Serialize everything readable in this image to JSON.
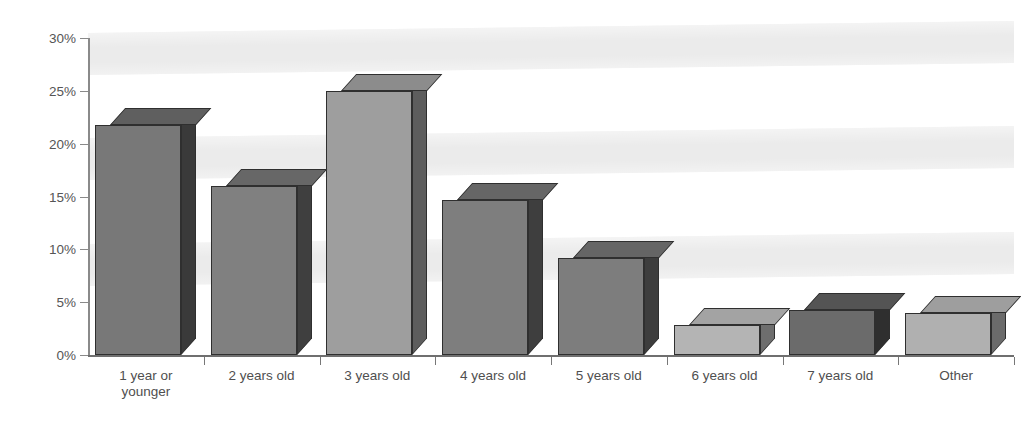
{
  "chart_data": {
    "type": "bar",
    "title": "",
    "subtitle": "",
    "xlabel": "",
    "ylabel": "",
    "categories": [
      "1 year or\nyounger",
      "2 years old",
      "3 years old",
      "4 years old",
      "5 years old",
      "6 years old",
      "7 years old",
      "Other"
    ],
    "values": [
      21.8,
      16.0,
      25.0,
      14.7,
      9.2,
      2.8,
      4.3,
      4.0
    ],
    "value_labels": [
      "",
      "",
      "",
      "",
      "",
      "",
      "",
      ""
    ],
    "ylim": [
      0,
      30
    ],
    "yticks": [
      0,
      5,
      10,
      15,
      20,
      25,
      30
    ],
    "ytick_labels": [
      "0%",
      "5%",
      "10%",
      "15%",
      "20%",
      "25%",
      "30%"
    ],
    "grid": false,
    "banded_background": true,
    "legend": null,
    "legend_position": "none",
    "style": "3d-bar",
    "bar_colors": [
      "#787878",
      "#808080",
      "#9e9e9e",
      "#7e7e7e",
      "#7d7d7d",
      "#b4b4b4",
      "#6b6b6b",
      "#b0b0b0"
    ],
    "bar_top_colors": [
      "#5f5f5f",
      "#676767",
      "#8c8c8c",
      "#666666",
      "#656565",
      "#a3a3a3",
      "#545454",
      "#9e9e9e"
    ],
    "bar_side_colors": [
      "#3a3a3a",
      "#3f3f3f",
      "#5d5d5d",
      "#3e3e3e",
      "#3d3d3d",
      "#6e6e6e",
      "#2f2f2f",
      "#6b6b6b"
    ],
    "background_color": "#ffffff",
    "band_color": "#ebebeb",
    "axis_color": "#808080"
  }
}
